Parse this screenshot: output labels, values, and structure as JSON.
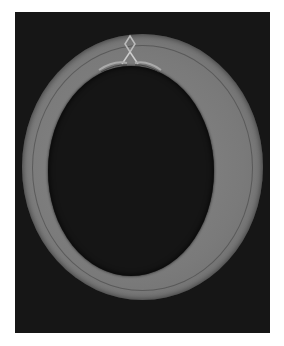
{
  "image": {
    "description": "Grayscale photograph of an oval ring-shaped object with a tied knot at the top, on a black background",
    "background_color": "#161616",
    "ring_color": "#7d7d7d",
    "page_background": "#ffffff"
  }
}
